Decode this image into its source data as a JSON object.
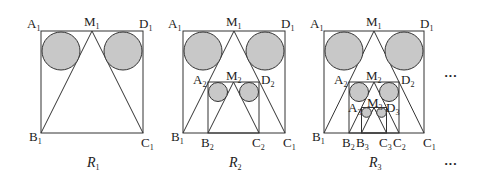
{
  "figures": [
    {
      "caption": "R",
      "caption_sub": "1",
      "labels": {
        "A1": "A",
        "M1": "M",
        "D1": "D",
        "B1": "B",
        "C1": "C"
      },
      "sub": "1"
    },
    {
      "caption": "R",
      "caption_sub": "2",
      "labels": {
        "A": "A",
        "M": "M",
        "D": "D",
        "B": "B",
        "C": "C"
      }
    },
    {
      "caption": "R",
      "caption_sub": "3"
    }
  ],
  "ellipsis_top": "···",
  "ellipsis_bottom": "···",
  "circle_color": "#c8c8c8"
}
